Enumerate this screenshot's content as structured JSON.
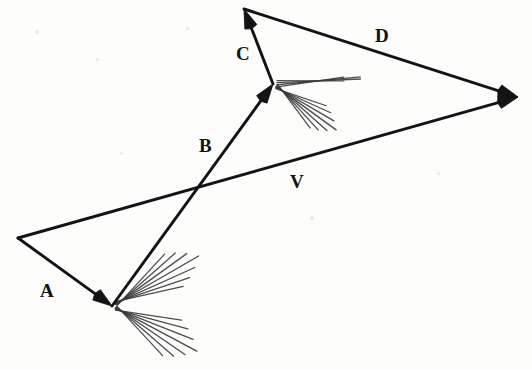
{
  "figure": {
    "background_color": "#fdfdfc",
    "ink_color": "#141414",
    "hatch_color": "#3a3a3a",
    "width": 532,
    "height": 370
  },
  "labels": [
    {
      "id": "A",
      "text": "A",
      "x": 40,
      "y": 281
    },
    {
      "id": "B",
      "text": "B",
      "x": 199,
      "y": 136
    },
    {
      "id": "C",
      "text": "C",
      "x": 236,
      "y": 44
    },
    {
      "id": "D",
      "text": "D",
      "x": 375,
      "y": 26
    },
    {
      "id": "V",
      "text": "V",
      "x": 290,
      "y": 172
    }
  ],
  "vectors": [
    {
      "id": "A",
      "label": "A",
      "from": [
        18,
        238
      ],
      "to": [
        112,
        306
      ],
      "arrowhead": "end",
      "description": "vector A from left vertex down-right to lower junction"
    },
    {
      "id": "B",
      "label": "B",
      "from": [
        112,
        306
      ],
      "to": [
        273,
        84
      ],
      "arrowhead": "end",
      "description": "vector B from lower junction up-right to middle junction"
    },
    {
      "id": "C",
      "label": "C",
      "from": [
        273,
        84
      ],
      "to": [
        244,
        9
      ],
      "arrowhead": "end",
      "description": "vector C from middle junction up-left to top apex"
    },
    {
      "id": "D",
      "label": "D",
      "from": [
        244,
        9
      ],
      "to": [
        518,
        97
      ],
      "arrowhead": "end",
      "description": "vector D from top apex down-right to right apex"
    },
    {
      "id": "V",
      "label": "V",
      "from": [
        18,
        238
      ],
      "to": [
        518,
        97
      ],
      "arrowhead": "end",
      "description": "resultant vector V from left vertex to right apex"
    }
  ],
  "junctions": [
    {
      "id": "lower-junction",
      "point": [
        112,
        306
      ],
      "hatch_groups": [
        {
          "count": 7,
          "direction": "upper-right",
          "angle_deg": -30,
          "length": 100,
          "spread_deg": 9
        },
        {
          "count": 7,
          "direction": "lower-right",
          "angle_deg": 28,
          "length": 96,
          "spread_deg": 10
        }
      ]
    },
    {
      "id": "middle-junction",
      "point": [
        273,
        84
      ],
      "hatch_groups": [
        {
          "count": 4,
          "direction": "right-flat",
          "angle_deg": -4,
          "length": 96,
          "spread_deg": 4
        },
        {
          "count": 7,
          "direction": "lower-right",
          "angle_deg": 36,
          "length": 78,
          "spread_deg": 9
        }
      ]
    }
  ],
  "specks": [
    {
      "x": 35,
      "y": 30,
      "r": 2
    },
    {
      "x": 96,
      "y": 58,
      "r": 1.5
    },
    {
      "x": 310,
      "y": 216,
      "r": 2
    },
    {
      "x": 120,
      "y": 152,
      "r": 1.5
    },
    {
      "x": 437,
      "y": 172,
      "r": 1.5
    },
    {
      "x": 186,
      "y": 27,
      "r": 1.5
    }
  ]
}
